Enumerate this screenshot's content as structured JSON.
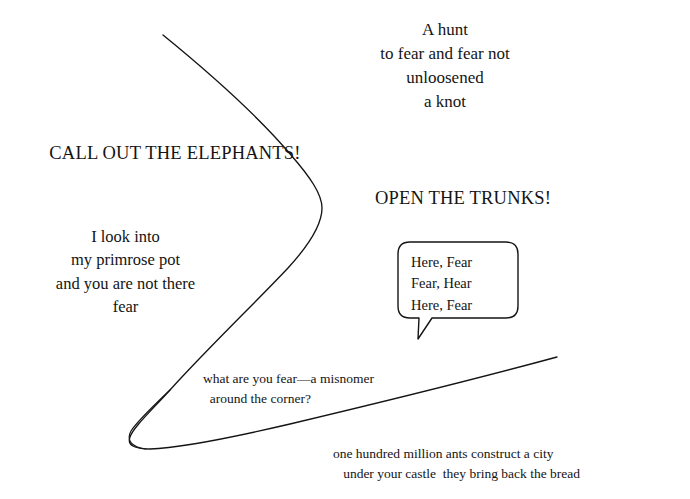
{
  "page": {
    "background_color": "#ffffff",
    "ink_color": "#141414",
    "width": 690,
    "height": 499
  },
  "poem_blocks": {
    "hunt": {
      "text": "A hunt\nto fear and fear not\nunloosened\na knot",
      "align": "center"
    },
    "call_out": {
      "text": "CALL OUT THE ELEPHANTS!",
      "align": "center"
    },
    "open_trunks": {
      "text": "OPEN THE TRUNKS!",
      "align": "center"
    },
    "primrose": {
      "text": "I look into\nmy primrose pot\nand you are not there\nfear",
      "align": "center"
    },
    "misnomer": {
      "text": "what are you fear—a misnomer\n  around the corner?",
      "align": "left"
    },
    "ants": {
      "text": "one hundred million ants construct a city\n   under your castle  they bring back the bread",
      "align": "left"
    }
  },
  "speech_bubble": {
    "lines": "Here, Fear\nFear, Hear\nHere, Fear",
    "stroke_color": "#141414",
    "fill_color": "#ffffff",
    "stroke_width": 1.4,
    "corner_radius": 12,
    "tail_direction": "down-left"
  },
  "line_art": {
    "stroke_color": "#141414",
    "stroke_width": 1.3,
    "fill": "none",
    "description": "single continuous hand-drawn contour: a long arc sweeping from upper-left down and right, bulging right, then sweeping back down-left into a narrow loop at bottom-left and out again to the right edge as a long shallow rising line",
    "main_curve_path": "M 163 35 C 215 78 272 128 305 172 C 321 193 324 208 318 224 C 308 250 268 292 222 338 C 178 382 146 406 133 424 C 124 437 127 445 141 448 C 163 452 206 443 259 429 C 330 410 440 380 557 357",
    "loop_return_path": "M 133 424 C 127 432 127 441 136 445"
  }
}
